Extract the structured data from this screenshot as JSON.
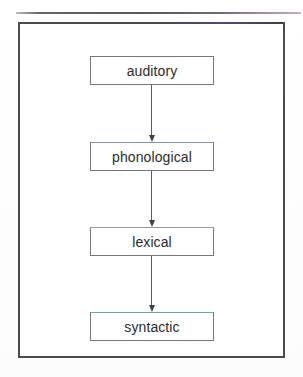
{
  "document": {
    "title": "Processing Levels Flowchart",
    "top_rule_color": "#4f4f55",
    "frame_border_color": "#4a4a50",
    "background_color": "#ffffff"
  },
  "diagram": {
    "type": "flowchart",
    "orientation": "vertical-top-to-bottom",
    "node_border_color": "#76767c",
    "node_fill_color": "#ffffff",
    "arrow_color": "#3f3f45",
    "text_color": "#2b2b2e",
    "nodes": [
      {
        "id": "auditory",
        "label": "auditory"
      },
      {
        "id": "phonological",
        "label": "phonological"
      },
      {
        "id": "lexical",
        "label": "lexical"
      },
      {
        "id": "syntactic",
        "label": "syntactic"
      }
    ],
    "edges": [
      {
        "from": "auditory",
        "to": "phonological",
        "style": "solid-arrow-down"
      },
      {
        "from": "phonological",
        "to": "lexical",
        "style": "solid-arrow-down"
      },
      {
        "from": "lexical",
        "to": "syntactic",
        "style": "solid-arrow-down"
      }
    ]
  }
}
